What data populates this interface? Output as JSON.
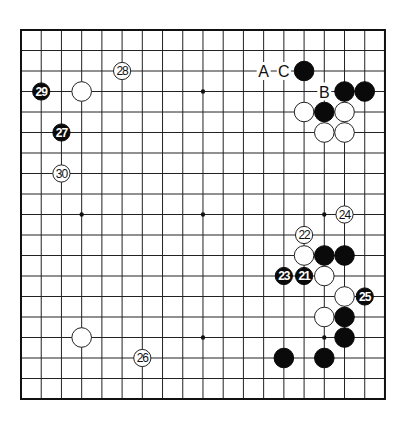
{
  "board": {
    "size": 19,
    "origin_px": {
      "x": 21,
      "y": 30
    },
    "spacing_px": {
      "x": 20.22,
      "y": 20.5
    },
    "hoshi": [
      [
        3,
        3
      ],
      [
        9,
        3
      ],
      [
        15,
        3
      ],
      [
        3,
        9
      ],
      [
        9,
        9
      ],
      [
        15,
        9
      ],
      [
        3,
        15
      ],
      [
        9,
        15
      ],
      [
        15,
        15
      ]
    ],
    "colors": {
      "black": "#0a0a0a",
      "white": "#ffffff",
      "line": "#222222"
    }
  },
  "stones": [
    {
      "color": "black",
      "col": 14,
      "row": 2,
      "label": ""
    },
    {
      "color": "black",
      "col": 16,
      "row": 3,
      "label": ""
    },
    {
      "color": "black",
      "col": 17,
      "row": 3,
      "label": ""
    },
    {
      "color": "white",
      "col": 14,
      "row": 4,
      "label": ""
    },
    {
      "color": "black",
      "col": 15,
      "row": 4,
      "label": ""
    },
    {
      "color": "white",
      "col": 16,
      "row": 4,
      "label": ""
    },
    {
      "color": "white",
      "col": 15,
      "row": 5,
      "label": ""
    },
    {
      "color": "white",
      "col": 16,
      "row": 5,
      "label": ""
    },
    {
      "color": "white",
      "col": 3,
      "row": 3,
      "label": ""
    },
    {
      "color": "white",
      "col": 14,
      "row": 11,
      "label": ""
    },
    {
      "color": "black",
      "col": 15,
      "row": 11,
      "label": ""
    },
    {
      "color": "black",
      "col": 16,
      "row": 11,
      "label": ""
    },
    {
      "color": "white",
      "col": 15,
      "row": 12,
      "label": ""
    },
    {
      "color": "white",
      "col": 16,
      "row": 13,
      "label": ""
    },
    {
      "color": "white",
      "col": 15,
      "row": 14,
      "label": ""
    },
    {
      "color": "black",
      "col": 16,
      "row": 14,
      "label": ""
    },
    {
      "color": "black",
      "col": 16,
      "row": 15,
      "label": ""
    },
    {
      "color": "black",
      "col": 13,
      "row": 16,
      "label": ""
    },
    {
      "color": "black",
      "col": 15,
      "row": 16,
      "label": ""
    },
    {
      "color": "white",
      "col": 3,
      "row": 15,
      "label": ""
    },
    {
      "color": "black",
      "col": 14,
      "row": 12,
      "label": "21"
    },
    {
      "color": "white",
      "col": 14,
      "row": 10,
      "label": "22"
    },
    {
      "color": "black",
      "col": 13,
      "row": 12,
      "label": "23"
    },
    {
      "color": "white",
      "col": 16,
      "row": 9,
      "label": "24"
    },
    {
      "color": "black",
      "col": 17,
      "row": 13,
      "label": "25"
    },
    {
      "color": "white",
      "col": 6,
      "row": 16,
      "label": "26"
    },
    {
      "color": "black",
      "col": 2,
      "row": 5,
      "label": "27"
    },
    {
      "color": "white",
      "col": 5,
      "row": 2,
      "label": "28"
    },
    {
      "color": "black",
      "col": 1,
      "row": 3,
      "label": "29"
    },
    {
      "color": "white",
      "col": 2,
      "row": 7,
      "label": "30"
    }
  ],
  "markers": [
    {
      "label": "A",
      "col": 12,
      "row": 2
    },
    {
      "label": "C",
      "col": 13,
      "row": 2
    },
    {
      "label": "B",
      "col": 15,
      "row": 3
    }
  ]
}
